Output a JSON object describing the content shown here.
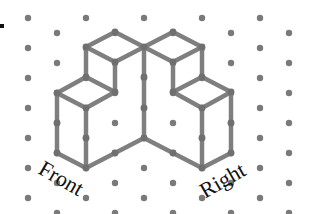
{
  "diagram": {
    "type": "isometric-dot-drawing",
    "labels": {
      "front": "Front",
      "right": "Right"
    },
    "colors": {
      "background": "#ffffff",
      "dot": "#7a7a7a",
      "edge": "#7f7f7f",
      "text": "#111111"
    },
    "grid": {
      "columns_x": [
        28,
        57,
        86,
        115,
        144,
        173,
        202,
        231,
        260,
        289
      ],
      "row_step": 30,
      "even_col_y_start": 18,
      "odd_col_y_start": 33
    }
  }
}
